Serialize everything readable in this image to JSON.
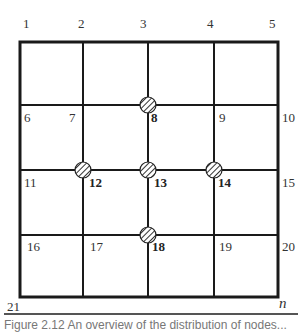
{
  "diagram": {
    "grid": {
      "columns_x": [
        20,
        83,
        148,
        214,
        278
      ],
      "rows_y": [
        42,
        105,
        170,
        235,
        297
      ],
      "line_color": "#1a1a1a",
      "outer_stroke": 3,
      "inner_stroke": 2
    },
    "markers": [
      {
        "node": "8",
        "x": 148,
        "y": 105
      },
      {
        "node": "12",
        "x": 83,
        "y": 170
      },
      {
        "node": "13",
        "x": 148,
        "y": 170
      },
      {
        "node": "14",
        "x": 214,
        "y": 170
      },
      {
        "node": "18",
        "x": 148,
        "y": 235
      }
    ],
    "labels": {
      "n1": "1",
      "n2": "2",
      "n3": "3",
      "n4": "4",
      "n5": "5",
      "n6": "6",
      "n7": "7",
      "n8": "8",
      "n9": "9",
      "n10": "10",
      "n11": "11",
      "n12": "12",
      "n13": "13",
      "n14": "14",
      "n15": "15",
      "n16": "16",
      "n17": "17",
      "n18": "18",
      "n19": "19",
      "n20": "20",
      "n21": "21",
      "nn": "n"
    }
  },
  "caption": {
    "text": "Figure 2.12  An overview of the distribution of nodes..."
  }
}
